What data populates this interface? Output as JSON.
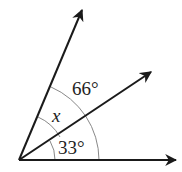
{
  "diagram": {
    "type": "angle-diagram",
    "vertex": {
      "x": 19,
      "y": 160
    },
    "rays": [
      {
        "name": "bottom-ray",
        "end": {
          "x": 176,
          "y": 160
        }
      },
      {
        "name": "middle-ray",
        "end": {
          "x": 151,
          "y": 72
        }
      },
      {
        "name": "top-ray",
        "end": {
          "x": 82,
          "y": 10
        }
      }
    ],
    "arcs": [
      {
        "name": "inner-arc",
        "radius": 36,
        "description": "arc spanning top-ray to bottom-ray (inner)"
      },
      {
        "name": "outer-arc",
        "radius": 80,
        "description": "arc spanning top-ray to bottom-ray (outer)"
      }
    ],
    "labels": {
      "angle_outer": "66°",
      "angle_x": "x",
      "angle_bottom": "33°"
    },
    "colors": {
      "ray": "#1a1a1a",
      "arc": "#888888",
      "text": "#222222"
    }
  }
}
